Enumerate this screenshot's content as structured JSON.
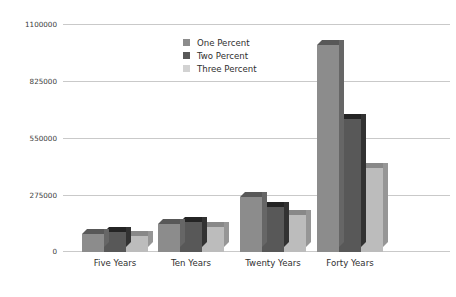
{
  "chart_data": {
    "type": "bar",
    "title": "",
    "subtitle": "",
    "xlabel": "",
    "ylabel": "",
    "categories": [
      "Five Years",
      "Ten Years",
      "Twenty Years",
      "Forty Years"
    ],
    "series": [
      {
        "name": "One Percent",
        "color": "#8c8c8c",
        "values": [
          87000,
          135000,
          265000,
          1003000
        ]
      },
      {
        "name": "Two Percent",
        "color": "#585858",
        "values": [
          97000,
          145000,
          217000,
          646000
        ]
      },
      {
        "name": "Three Percent",
        "color": "#bcbcbc",
        "values": [
          77000,
          120000,
          178000,
          405000
        ]
      }
    ],
    "yticks": [
      0,
      275000,
      550000,
      825000,
      1100000
    ],
    "ytick_labels": [
      "0",
      "275000",
      "550000",
      "825000",
      "1100000"
    ],
    "ylim": [
      0,
      1100000
    ],
    "grid": true,
    "grid_color": "#c9c9c9",
    "legend_position": "top-center",
    "style": "3d-bar",
    "background": "#ffffff"
  },
  "legend": {
    "items": [
      {
        "label": "One Percent",
        "swatch": "legend-swatch-one-percent"
      },
      {
        "label": "Two Percent",
        "swatch": "legend-swatch-two-percent"
      },
      {
        "label": "Three Percent",
        "swatch": "legend-swatch-three-percent"
      }
    ]
  }
}
